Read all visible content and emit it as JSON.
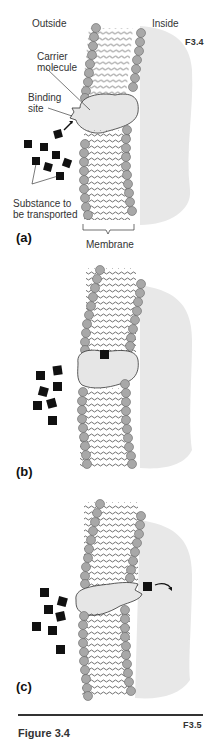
{
  "figure": {
    "code_top": "F3.4",
    "code_bottom": "F3.5",
    "caption_partial": "Figure 3.4"
  },
  "labels": {
    "outside": "Outside",
    "inside": "Inside",
    "carrier_line1": "Carrier",
    "carrier_line2": "molecule",
    "binding_line1": "Binding",
    "binding_line2": "site",
    "substance_line1": "Substance to",
    "substance_line2": "be transported",
    "membrane": "Membrane"
  },
  "panels": [
    {
      "label": "(a)",
      "state": "substance approaching binding site"
    },
    {
      "label": "(b)",
      "state": "substance bound inside carrier"
    },
    {
      "label": "(c)",
      "state": "substance released to inside"
    }
  ],
  "colors": {
    "phospholipid_head": "#a8a8a8",
    "carrier": "#e6e6e6",
    "cytoplasm": "#e8e8e8",
    "substance": "#111111"
  }
}
